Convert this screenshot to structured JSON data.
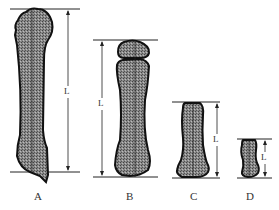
{
  "figure": {
    "bones": [
      {
        "label": "A",
        "dimension_label": "L"
      },
      {
        "label": "B",
        "dimension_label": "L"
      },
      {
        "label": "C",
        "dimension_label": "L"
      },
      {
        "label": "D",
        "dimension_label": "L"
      }
    ],
    "colors": {
      "fill": "#7a7a7a",
      "outline": "#111111",
      "line": "#222222"
    }
  }
}
